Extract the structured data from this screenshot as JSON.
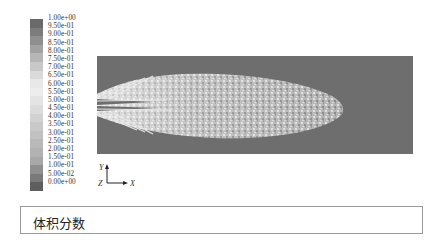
{
  "legend": {
    "title": "体积分数",
    "labels": [
      "1.00e+00",
      "9.50e-01",
      "9.00e-01",
      "8.50e-01",
      "8.00e-01",
      "7.50e-01",
      "7.00e-01",
      "6.50e-01",
      "6.00e-01",
      "5.50e-01",
      "5.00e-01",
      "4.50e-01",
      "4.00e-01",
      "3.50e-01",
      "3.00e-01",
      "2.50e-01",
      "2.00e-01",
      "1.50e-01",
      "1.00e-01",
      "5.00e-02",
      "0.00e+00"
    ],
    "colors": [
      "#6a6a6a",
      "#7c7c7c",
      "#8f8f8f",
      "#a2a2a2",
      "#b6b6b6",
      "#c8c8c8",
      "#dadada",
      "#e8e8e8",
      "#ededed",
      "#e4e4e4",
      "#dcdcdc",
      "#d2d2d2",
      "#c9c9c9",
      "#c1c1c1",
      "#b9b9b9",
      "#b2b2b2",
      "#a8a8a8",
      "#8f8f8f",
      "#7a7a7a",
      "#5e5e5e"
    ]
  },
  "axes": {
    "y_label": "Y",
    "z_label": "Z",
    "x_label": "X"
  },
  "plot": {
    "background": "#6e6e6e",
    "description": "volume fraction contour of jet spray"
  },
  "caption": {
    "text": "体积分数"
  }
}
